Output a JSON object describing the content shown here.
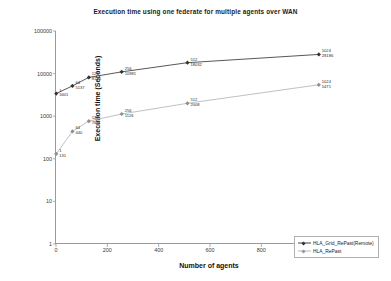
{
  "chart_data": {
    "type": "line",
    "title": "Execution time using one federate for multiple agents over WAN",
    "xlabel": "Number of agents",
    "ylabel": "Execution time (Seconds)",
    "yscale": "log",
    "xscale": "linear",
    "xlim": [
      0,
      1200
    ],
    "ylim": [
      1,
      100000
    ],
    "grid": false,
    "legend_position": "lower-right-inside",
    "xticks": [
      "0",
      "200",
      "400",
      "600",
      "800",
      "1000",
      "1200"
    ],
    "xtick_values": [
      0,
      200,
      400,
      600,
      800,
      1000,
      1200
    ],
    "yticks": [
      "1",
      "10",
      "100",
      "1000",
      "10000",
      "100000"
    ],
    "ytick_values": [
      1,
      10,
      100,
      1000,
      10000,
      100000
    ],
    "x": [
      1,
      64,
      128,
      256,
      512,
      1024
    ],
    "series": [
      {
        "name": "HLA_Grid_RePast(Remote)",
        "color": "#444444",
        "marker": "diamond",
        "values": [
          3401,
          5137,
          8146,
          10981,
          18032,
          28186
        ],
        "point_labels": [
          {
            "x": "1",
            "y": "3401"
          },
          {
            "x": "64",
            "y": "5137"
          },
          {
            "x": "128",
            "y": "8146"
          },
          {
            "x": "256",
            "y": "10981"
          },
          {
            "x": "512",
            "y": "18032"
          },
          {
            "x": "1024",
            "y": "28186"
          }
        ]
      },
      {
        "name": "HLA_RePast",
        "color": "#b9b9b9",
        "marker": "diamond",
        "values": [
          131,
          440,
          766,
          1126,
          2008,
          5471
        ],
        "point_labels": [
          {
            "x": "1",
            "y": "131"
          },
          {
            "x": "64",
            "y": "440"
          },
          {
            "x": "128",
            "y": "766"
          },
          {
            "x": "256",
            "y": "1126"
          },
          {
            "x": "512",
            "y": "2008"
          },
          {
            "x": "1024",
            "y": "5471"
          }
        ]
      }
    ]
  }
}
